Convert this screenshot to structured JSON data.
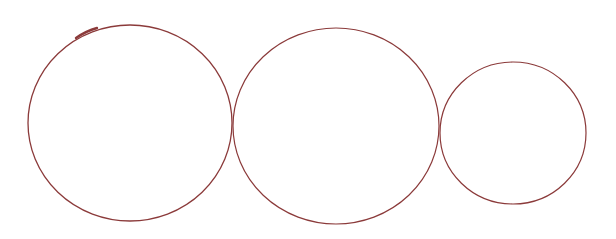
{
  "diagram": {
    "background": "#ffffff",
    "stroke_color": "#8b3a3a",
    "circles": [
      {
        "label": "left-circle",
        "cx": 130,
        "cy": 123,
        "rx": 102,
        "ry": 98,
        "stroke_width": 1.3
      },
      {
        "label": "middle-circle",
        "cx": 336,
        "cy": 126,
        "rx": 103,
        "ry": 98,
        "stroke_width": 1.2
      },
      {
        "label": "right-circle",
        "cx": 513,
        "cy": 133,
        "rx": 73,
        "ry": 71,
        "stroke_width": 1.2
      }
    ],
    "accent_stroke": {
      "description": "thicker pen mark on upper-left arc of left circle",
      "path": "M 76 38 Q 86 31 97 28",
      "stroke_width": 2.4
    }
  }
}
